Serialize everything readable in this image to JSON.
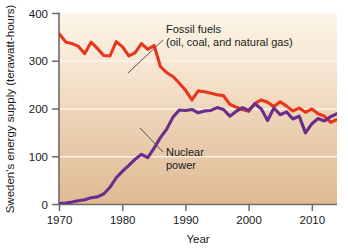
{
  "chart_data": {
    "type": "line",
    "title": "",
    "xlabel": "Year",
    "ylabel": "Sweden's energy supply (terawatt-hours)",
    "xlim": [
      1970,
      2014
    ],
    "ylim": [
      0,
      400
    ],
    "xticks": [
      1970,
      1980,
      1990,
      2000,
      2010
    ],
    "yticks": [
      0,
      100,
      200,
      300,
      400
    ],
    "grid": "horizontal",
    "legend_position": "inline-annotations",
    "plot_background": "cream-to-tan vertical gradient",
    "series": [
      {
        "name": "Fossil fuels (oil, coal, and natural gas)",
        "color": "#E8361C",
        "annotation_lines": [
          "Fossil fuels",
          "(oil, coal, and natural gas)"
        ],
        "x": [
          1970,
          1971,
          1972,
          1973,
          1974,
          1975,
          1976,
          1977,
          1978,
          1979,
          1980,
          1981,
          1982,
          1983,
          1984,
          1985,
          1986,
          1987,
          1988,
          1989,
          1990,
          1991,
          1992,
          1993,
          1994,
          1995,
          1996,
          1997,
          1998,
          1999,
          2000,
          2001,
          2002,
          2003,
          2004,
          2005,
          2006,
          2007,
          2008,
          2009,
          2010,
          2011,
          2012,
          2013,
          2014
        ],
        "values": [
          357,
          340,
          337,
          331,
          316,
          340,
          327,
          312,
          311,
          341,
          330,
          311,
          318,
          337,
          325,
          333,
          289,
          276,
          268,
          254,
          239,
          219,
          238,
          236,
          233,
          230,
          228,
          210,
          204,
          199,
          195,
          212,
          219,
          214,
          205,
          215,
          206,
          196,
          202,
          193,
          200,
          190,
          185,
          172,
          178
        ]
      },
      {
        "name": "Nuclear power",
        "color": "#6B2D8B",
        "annotation_lines": [
          "Nuclear",
          "power"
        ],
        "x": [
          1970,
          1971,
          1972,
          1973,
          1974,
          1975,
          1976,
          1977,
          1978,
          1979,
          1980,
          1981,
          1982,
          1983,
          1984,
          1985,
          1986,
          1987,
          1988,
          1989,
          1990,
          1991,
          1992,
          1993,
          1994,
          1995,
          1996,
          1997,
          1998,
          1999,
          2000,
          2001,
          2002,
          2003,
          2004,
          2005,
          2006,
          2007,
          2008,
          2009,
          2010,
          2011,
          2012,
          2013,
          2014
        ],
        "values": [
          2,
          3,
          5,
          8,
          10,
          14,
          16,
          22,
          36,
          56,
          70,
          82,
          95,
          105,
          98,
          118,
          140,
          158,
          183,
          198,
          197,
          199,
          192,
          196,
          197,
          203,
          199,
          185,
          195,
          203,
          197,
          211,
          200,
          176,
          202,
          188,
          194,
          179,
          185,
          150,
          169,
          180,
          175,
          184,
          190
        ]
      }
    ]
  },
  "axes": {
    "y_title": "Sweden's energy supply (terawatt-hours)",
    "x_title": "Year",
    "y_tick_labels": [
      "400",
      "300",
      "200",
      "100",
      "0"
    ],
    "x_tick_labels": [
      "1970",
      "1980",
      "1990",
      "2000",
      "2010"
    ]
  },
  "annotations": {
    "fossil": {
      "line1": "Fossil fuels",
      "line2": "(oil, coal, and natural gas)"
    },
    "nuclear": {
      "line1": "Nuclear",
      "line2": "power"
    }
  },
  "colors": {
    "fossil": "#E8361C",
    "nuclear": "#6B2D8B",
    "axis": "#6b6b6b",
    "grid": "#f3ece1",
    "plot_top": "#fbf3e2",
    "plot_bottom": "#e2bd96"
  }
}
